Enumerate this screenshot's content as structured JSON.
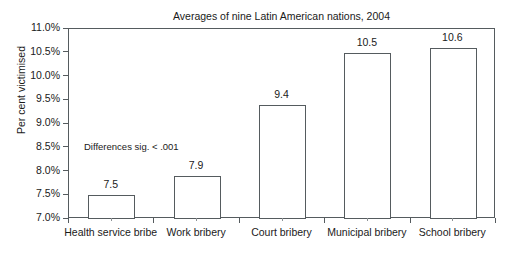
{
  "chart_data": {
    "type": "bar",
    "title": "Averages of nine Latin American nations, 2004",
    "xlabel": "",
    "ylabel": "Per cent victimised",
    "categories": [
      "Health service bribe",
      "Work bribery",
      "Court bribery",
      "Municipal bribery",
      "School bribery"
    ],
    "values": [
      7.5,
      7.9,
      9.4,
      10.5,
      10.6
    ],
    "value_labels": [
      "7.5",
      "7.9",
      "9.4",
      "10.5",
      "10.6"
    ],
    "ylim": [
      7.0,
      11.0
    ],
    "ytick_values": [
      7.0,
      7.5,
      8.0,
      8.5,
      9.0,
      9.5,
      10.0,
      10.5,
      11.0
    ],
    "ytick_labels": [
      "11.0%",
      "10.5%",
      "10.0%",
      "9.5%",
      "9.0%",
      "8.5%",
      "8.0%",
      "7.5%",
      "7.0%"
    ],
    "grid": false,
    "legend": null,
    "annotations": [
      {
        "text": "Differences sig. < .001",
        "x_category": "Health service bribe",
        "y_value": 8.6
      }
    ],
    "bar_style": {
      "fill": "#ffffff",
      "edge": "#555b5e"
    }
  }
}
